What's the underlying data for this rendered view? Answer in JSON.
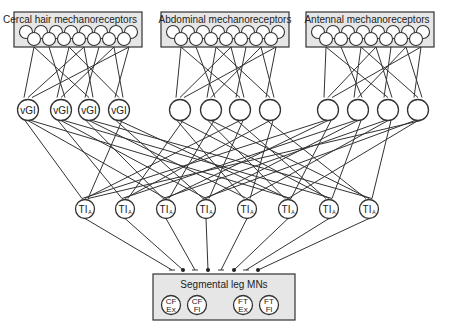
{
  "diagram": {
    "sensory_groups": [
      {
        "id": "cercal",
        "label": "Cercal hair mechanoreceptors"
      },
      {
        "id": "abdominal",
        "label": "Abdominal mechanoreceptors"
      },
      {
        "id": "antennal",
        "label": "Antennal mechanoreceptors"
      }
    ],
    "interneurons_layer1": {
      "cercal": [
        "vGI",
        "vGI",
        "vGI",
        "vGI"
      ],
      "abdominal": [
        "",
        "",
        "",
        ""
      ],
      "antennal": [
        "",
        "",
        "",
        ""
      ]
    },
    "interneurons_layer2": {
      "label_main": "TI",
      "label_sub": "A",
      "count": 8
    },
    "motor_box": {
      "title": "Segmental leg MNs",
      "neurons": [
        {
          "top": "CF",
          "bottom": "Ex"
        },
        {
          "top": "CF",
          "bottom": "Fl"
        },
        {
          "top": "FT",
          "bottom": "Ex"
        },
        {
          "top": "FT",
          "bottom": "Fl"
        }
      ]
    },
    "synapse_types": {
      "bar": "inhibitory",
      "dot": "excitatory"
    },
    "colors": {
      "box_fill": "#e6e6e6",
      "stroke": "#333333",
      "background": "#ffffff"
    }
  }
}
